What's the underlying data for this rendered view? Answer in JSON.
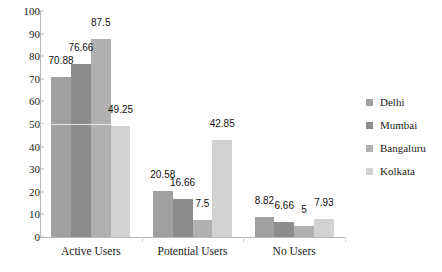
{
  "chart_data": {
    "type": "bar",
    "title": "",
    "subtitle": "",
    "xlabel": "",
    "ylabel": "",
    "categories": [
      "Active Users",
      "Potential Users",
      "No Users"
    ],
    "series": [
      {
        "name": "Delhi",
        "color": "#a0a0a0",
        "values": [
          70.88,
          20.58,
          8.82
        ]
      },
      {
        "name": "Mumbai",
        "color": "#8c8c8c",
        "values": [
          76.66,
          16.66,
          6.66
        ]
      },
      {
        "name": "Bangaluru",
        "color": "#b0b0b0",
        "values": [
          87.5,
          7.5,
          5
        ]
      },
      {
        "name": "Kolkata",
        "color": "#d2d2d2",
        "values": [
          49.25,
          42.85,
          7.93
        ]
      }
    ],
    "value_labels": [
      [
        "70.88",
        "76.66",
        "87.5",
        "49.25"
      ],
      [
        "20.58",
        "16.66",
        "7.5",
        "42.85"
      ],
      [
        "8.82",
        "6.66",
        "5",
        "7.93"
      ]
    ],
    "ylim": [
      0,
      100
    ],
    "yticks": [
      0,
      10,
      20,
      30,
      40,
      50,
      60,
      70,
      80,
      90,
      100
    ],
    "ytick_labels": [
      "0",
      "10",
      "20",
      "30",
      "40",
      "50",
      "60",
      "70",
      "80",
      "90",
      "100"
    ],
    "grid": "single-faint-line-at-50",
    "gridlines": [
      50
    ],
    "legend_position": "right",
    "axis_color": "#b9b9b9",
    "text_color": "#1a1a1a"
  },
  "legend": {
    "items": [
      {
        "label": "Delhi"
      },
      {
        "label": "Mumbai"
      },
      {
        "label": "Bangaluru"
      },
      {
        "label": "Kolkata"
      }
    ]
  }
}
